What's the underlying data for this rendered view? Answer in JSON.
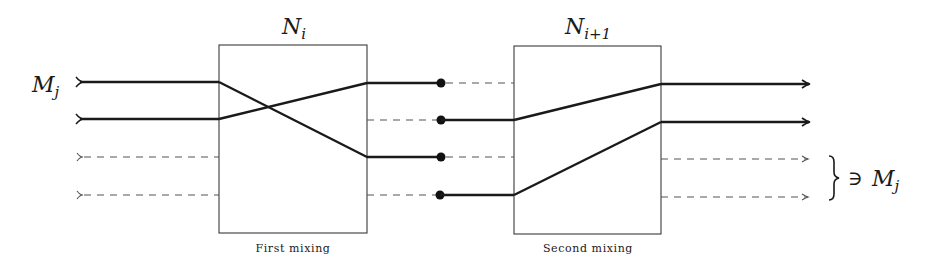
{
  "diagram": {
    "type": "mixing-network",
    "colors": {
      "stroke_solid": "#1a1a1a",
      "stroke_dashed": "#555555",
      "box": "#3a3a3a",
      "background": "#ffffff"
    },
    "input_label": {
      "base": "M",
      "sub": "j"
    },
    "output_label": {
      "prefix": "} ∋ ",
      "base": "M",
      "sub": "j"
    },
    "boxes": [
      {
        "id": "N_i",
        "title_base": "N",
        "title_sub": "i",
        "caption": "First mixing"
      },
      {
        "id": "N_i+1",
        "title_base": "N",
        "title_sub": "i+1",
        "caption": "Second mixing"
      }
    ],
    "wires": {
      "count": 4,
      "inputs": [
        "solid",
        "solid",
        "dashed",
        "dashed"
      ],
      "first_mixing_permutation": [
        {
          "from": 1,
          "to": 3,
          "style": "solid"
        },
        {
          "from": 2,
          "to": 1,
          "style": "solid"
        }
      ],
      "between_stages": [
        {
          "wire": 1,
          "left": "solid",
          "right": "dashed"
        },
        {
          "wire": 2,
          "left": "dashed",
          "right": "solid"
        },
        {
          "wire": 3,
          "left": "solid",
          "right": "dashed"
        },
        {
          "wire": 4,
          "left": "dashed",
          "right": "solid"
        }
      ],
      "second_mixing_permutation": [
        {
          "from": 2,
          "to": 1,
          "style": "solid"
        },
        {
          "from": 4,
          "to": 2,
          "style": "solid"
        }
      ],
      "outputs": [
        "solid",
        "solid",
        "dashed",
        "dashed"
      ]
    }
  }
}
